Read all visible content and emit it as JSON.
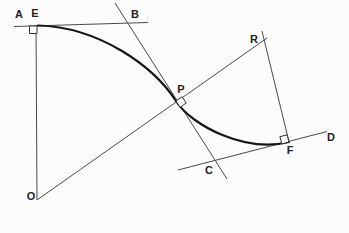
{
  "figure": {
    "name": "ogee-curve-tangent-normal-construction",
    "background": "#fcfcfc",
    "line_color": "#4a4a4a",
    "curve_color": "#161616",
    "label_color": "#1f1f1f",
    "width": 349,
    "height": 233,
    "labels": [
      {
        "id": "A",
        "text": "A",
        "x": 19,
        "y": 18
      },
      {
        "id": "E",
        "text": "E",
        "x": 35,
        "y": 17
      },
      {
        "id": "B",
        "text": "B",
        "x": 135,
        "y": 18
      },
      {
        "id": "R",
        "text": "R",
        "x": 254,
        "y": 43
      },
      {
        "id": "P",
        "text": "P",
        "x": 181,
        "y": 93
      },
      {
        "id": "C",
        "text": "C",
        "x": 209,
        "y": 174
      },
      {
        "id": "D",
        "text": "D",
        "x": 331,
        "y": 141
      },
      {
        "id": "F",
        "text": "F",
        "x": 290,
        "y": 154
      },
      {
        "id": "O",
        "text": "O",
        "x": 31,
        "y": 200
      }
    ],
    "lines": [
      {
        "id": "tangent-AEB",
        "x1": 14,
        "y1": 26.5,
        "x2": 148,
        "y2": 22.5
      },
      {
        "id": "vertical-EO",
        "x1": 36,
        "y1": 25.5,
        "x2": 37,
        "y2": 200
      },
      {
        "id": "normal-OPR",
        "x1": 37,
        "y1": 200,
        "x2": 267,
        "y2": 38
      },
      {
        "id": "tangent-BPC",
        "x1": 115,
        "y1": 3,
        "x2": 227,
        "y2": 179
      },
      {
        "id": "tangent-CFD",
        "x1": 178,
        "y1": 170,
        "x2": 327,
        "y2": 131.5
      },
      {
        "id": "normal-RF",
        "x1": 262,
        "y1": 31,
        "x2": 289,
        "y2": 142
      }
    ],
    "curve": {
      "id": "ogee-curve",
      "path": "M 38 25.5 C 100 27 154 67 176 101 C 192 126 246 153 289 142"
    },
    "right_angle_markers": [
      {
        "id": "E",
        "points": "29.5,26 37,26 37,33.5 29.5,33.5"
      },
      {
        "id": "P",
        "points": "176,101 180,107.3 186.2,103.1 182.1,96.7"
      },
      {
        "id": "F",
        "points": "289,142 281.8,143.9 279.9,136.7 287.2,134.8"
      }
    ]
  }
}
